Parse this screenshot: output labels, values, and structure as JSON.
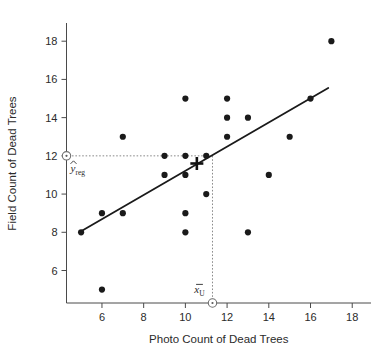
{
  "chart_data": {
    "type": "scatter",
    "title": "",
    "xlabel": "Photo Count of Dead Trees",
    "ylabel": "Field Count of Dead Trees",
    "xlim": [
      4.3,
      18.9
    ],
    "ylim": [
      4.3,
      18.9
    ],
    "xticks": [
      6,
      8,
      10,
      12,
      14,
      16,
      18
    ],
    "yticks": [
      6,
      8,
      10,
      12,
      14,
      16,
      18
    ],
    "xtick_labels": [
      "6",
      "8",
      "10",
      "12",
      "14",
      "16",
      "18"
    ],
    "ytick_labels": [
      "6",
      "8",
      "10",
      "12",
      "14",
      "16",
      "18"
    ],
    "grid": false,
    "legend": false,
    "points": [
      {
        "x": 5,
        "y": 8
      },
      {
        "x": 6,
        "y": 9
      },
      {
        "x": 6,
        "y": 5
      },
      {
        "x": 7,
        "y": 13
      },
      {
        "x": 7,
        "y": 9
      },
      {
        "x": 9,
        "y": 12
      },
      {
        "x": 9,
        "y": 11
      },
      {
        "x": 10,
        "y": 15
      },
      {
        "x": 10,
        "y": 12
      },
      {
        "x": 10,
        "y": 11
      },
      {
        "x": 10,
        "y": 9
      },
      {
        "x": 10,
        "y": 8
      },
      {
        "x": 11,
        "y": 12
      },
      {
        "x": 11,
        "y": 10
      },
      {
        "x": 12,
        "y": 15
      },
      {
        "x": 12,
        "y": 14
      },
      {
        "x": 12,
        "y": 13
      },
      {
        "x": 13,
        "y": 14
      },
      {
        "x": 13,
        "y": 8
      },
      {
        "x": 14,
        "y": 11
      },
      {
        "x": 15,
        "y": 13
      },
      {
        "x": 16,
        "y": 15
      },
      {
        "x": 17,
        "y": 18
      }
    ],
    "regression_line": {
      "x_start": 5.0,
      "y_start": 8.05,
      "x_end": 16.85,
      "y_end": 15.55
    },
    "centroid_marker": {
      "x": 10.55,
      "y": 11.6,
      "style": "plus"
    },
    "annotations": [
      {
        "name": "y-hat-reg",
        "label": "y",
        "subscript": "reg",
        "accent": "hat",
        "axis_value": 12,
        "axis": "y",
        "marker": "open-circle-with-dot"
      },
      {
        "name": "x-bar-u",
        "label": "x",
        "subscript": "U",
        "accent": "bar",
        "axis_value": 11.3,
        "axis": "x",
        "marker": "open-circle-with-dot"
      }
    ],
    "guide_lines": [
      {
        "name": "horizontal-guide-to-yreg",
        "from": [
          4.4,
          12
        ],
        "to": [
          11.3,
          12
        ]
      },
      {
        "name": "vertical-guide-to-xbar",
        "from": [
          11.3,
          12
        ],
        "to": [
          11.3,
          4.38
        ]
      }
    ]
  },
  "colors": {
    "point": "#1a1a1a",
    "axis": "#4a4a4a",
    "regression": "#1a1a1a",
    "guide": "#8a8a8a",
    "background": "#ffffff"
  }
}
